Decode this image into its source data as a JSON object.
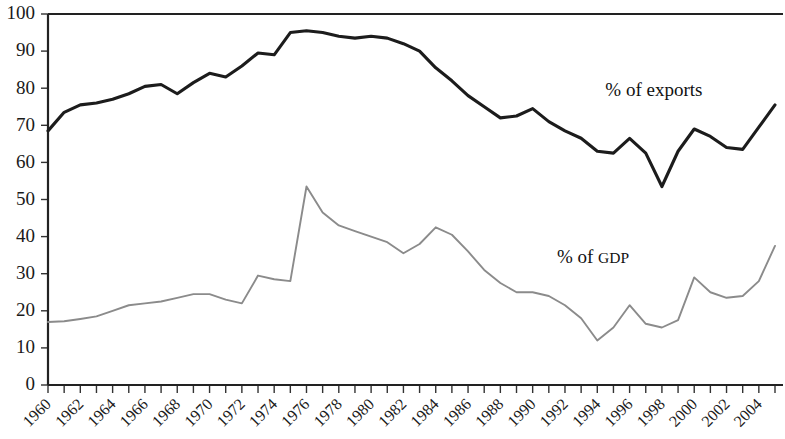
{
  "chart_data": {
    "type": "line",
    "title": "",
    "subtitle": "",
    "xlabel": "",
    "ylabel": "",
    "xlim": [
      1960,
      2005
    ],
    "ylim": [
      0,
      100
    ],
    "grid": false,
    "legend_position": "inline-annotation",
    "y_ticks": [
      0,
      10,
      20,
      30,
      40,
      50,
      60,
      70,
      80,
      90,
      100
    ],
    "y_tick_labels": [
      "0",
      "10",
      "20",
      "30",
      "40",
      "50",
      "60",
      "70",
      "80",
      "90",
      "100"
    ],
    "x_tick_labels": [
      "1960",
      "1962",
      "1964",
      "1966",
      "1968",
      "1970",
      "1972",
      "1974",
      "1976",
      "1978",
      "1980",
      "1982",
      "1984",
      "1986",
      "1988",
      "1990",
      "1992",
      "1994",
      "1996",
      "1998",
      "2000",
      "2002",
      "2004"
    ],
    "x_tick_values": [
      1960,
      1962,
      1964,
      1966,
      1968,
      1970,
      1972,
      1974,
      1976,
      1978,
      1980,
      1982,
      1984,
      1986,
      1988,
      1990,
      1992,
      1994,
      1996,
      1998,
      2000,
      2002,
      2004
    ],
    "x_minor_ticks_every": 1,
    "x": [
      1960,
      1961,
      1962,
      1963,
      1964,
      1965,
      1966,
      1967,
      1968,
      1969,
      1970,
      1971,
      1972,
      1973,
      1974,
      1975,
      1976,
      1977,
      1978,
      1979,
      1980,
      1981,
      1982,
      1983,
      1984,
      1985,
      1986,
      1987,
      1988,
      1989,
      1990,
      1991,
      1992,
      1993,
      1994,
      1995,
      1996,
      1997,
      1998,
      1999,
      2000,
      2001,
      2002,
      2003,
      2004,
      2005
    ],
    "series": [
      {
        "name": "% of exports",
        "color": "#1c1c1c",
        "label_x": 1994.5,
        "label_y": 78,
        "values": [
          68.5,
          73.5,
          75.5,
          76.0,
          77.0,
          78.5,
          80.5,
          81.0,
          78.5,
          81.5,
          84.0,
          83.0,
          86.0,
          89.5,
          89.0,
          95.0,
          95.5,
          95.0,
          94.0,
          93.5,
          94.0,
          93.5,
          92.0,
          90.0,
          85.5,
          82.0,
          78.0,
          75.0,
          72.0,
          72.5,
          74.5,
          71.0,
          68.5,
          66.5,
          63.0,
          62.5,
          66.5,
          62.5,
          53.5,
          63.0,
          69.0,
          67.0,
          64.0,
          63.5,
          69.5,
          75.5
        ]
      },
      {
        "name": "% of GDP",
        "color": "#8b8b8b",
        "label_x": 1991.5,
        "label_y": 33,
        "values": [
          17.0,
          17.2,
          17.8,
          18.5,
          20.0,
          21.5,
          22.0,
          22.5,
          23.5,
          24.5,
          24.5,
          23.0,
          22.0,
          29.5,
          28.5,
          28.0,
          53.5,
          46.5,
          43.0,
          41.5,
          40.0,
          38.5,
          35.5,
          38.0,
          42.5,
          40.5,
          36.0,
          31.0,
          27.5,
          25.0,
          25.0,
          24.0,
          21.5,
          18.0,
          12.0,
          15.5,
          17.5,
          16.5,
          18.5,
          22.0,
          21.5,
          20.5,
          19.5,
          18.5,
          20.0,
          22.0
        ]
      }
    ],
    "series_note": "GDP series continues: 1996-2005 values re-read from plot",
    "gdp_tail_values": [
      21.5,
      16.5,
      15.5,
      17.5,
      29.0,
      25.0,
      23.5,
      24.0,
      28.0,
      37.5
    ]
  },
  "annotations": {
    "exports_label": "% of exports",
    "gdp_label_prefix": "% of ",
    "gdp_label_suffix": "GDP"
  }
}
